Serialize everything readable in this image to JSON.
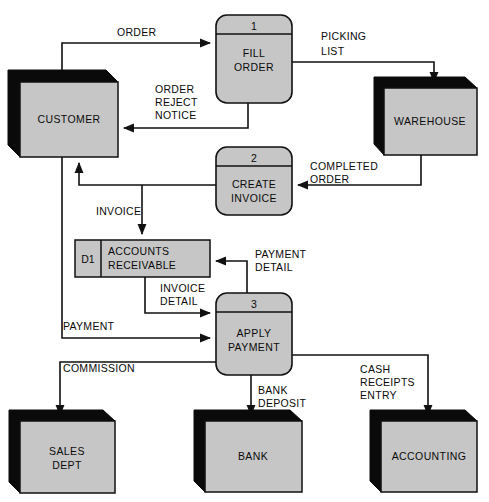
{
  "diagram": {
    "type": "data-flow-diagram",
    "colors": {
      "fill": "#c6c6c6",
      "stroke": "#111111",
      "shadow": "#0a0a0a",
      "background": "#ffffff"
    }
  },
  "external_entities": [
    {
      "id": "customer",
      "label": "CUSTOMER",
      "x": 20,
      "y": 82,
      "w": 98,
      "h": 75
    },
    {
      "id": "warehouse",
      "label": "WAREHOUSE",
      "x": 384,
      "y": 88,
      "w": 93,
      "h": 67
    },
    {
      "id": "sales_dept",
      "label_line1": "SALES",
      "label_line2": "DEPT",
      "x": 20,
      "y": 421,
      "w": 95,
      "h": 72
    },
    {
      "id": "bank",
      "label": "BANK",
      "x": 205,
      "y": 421,
      "w": 97,
      "h": 71
    },
    {
      "id": "accounting",
      "label": "ACCOUNTING",
      "x": 381,
      "y": 421,
      "w": 96,
      "h": 71
    }
  ],
  "processes": [
    {
      "id": "fill_order",
      "number": "1",
      "label_line1": "FILL",
      "label_line2": "ORDER",
      "x": 216,
      "y": 15,
      "w": 76,
      "h": 88
    },
    {
      "id": "create_invoice",
      "number": "2",
      "label_line1": "CREATE",
      "label_line2": "INVOICE",
      "x": 216,
      "y": 147,
      "w": 76,
      "h": 68
    },
    {
      "id": "apply_payment",
      "number": "3",
      "label_line1": "APPLY",
      "label_line2": "PAYMENT",
      "x": 216,
      "y": 293,
      "w": 76,
      "h": 82
    }
  ],
  "data_stores": [
    {
      "id": "accounts_receivable",
      "store_id": "D1",
      "label_line1": "ACCOUNTS",
      "label_line2": "RECEIVABLE",
      "x": 75,
      "y": 240,
      "w": 135,
      "h": 37,
      "divider_x": 101
    }
  ],
  "data_flows": [
    {
      "id": "order",
      "label": "ORDER",
      "from": "customer",
      "to": "fill_order"
    },
    {
      "id": "picking_list",
      "label_line1": "PICKING",
      "label_line2": "LIST",
      "from": "fill_order",
      "to": "warehouse"
    },
    {
      "id": "order_reject",
      "label_line1": "ORDER",
      "label_line2": "REJECT",
      "label_line3": "NOTICE",
      "from": "fill_order",
      "to": "customer"
    },
    {
      "id": "completed_order",
      "label_line1": "COMPLETED",
      "label_line2": "ORDER",
      "from": "warehouse",
      "to": "create_invoice"
    },
    {
      "id": "invoice",
      "label": "INVOICE",
      "from": "create_invoice",
      "to": "customer"
    },
    {
      "id": "invoice_store",
      "label": "INVOICE",
      "from": "create_invoice",
      "to": "accounts_receivable"
    },
    {
      "id": "invoice_detail",
      "label_line1": "INVOICE",
      "label_line2": "DETAIL",
      "from": "accounts_receivable",
      "to": "apply_payment"
    },
    {
      "id": "payment_detail",
      "label_line1": "PAYMENT",
      "label_line2": "DETAIL",
      "from": "apply_payment",
      "to": "accounts_receivable"
    },
    {
      "id": "payment",
      "label": "PAYMENT",
      "from": "customer",
      "to": "apply_payment"
    },
    {
      "id": "commission",
      "label": "COMMISSION",
      "from": "apply_payment",
      "to": "sales_dept"
    },
    {
      "id": "bank_deposit",
      "label_line1": "BANK",
      "label_line2": "DEPOSIT",
      "from": "apply_payment",
      "to": "bank"
    },
    {
      "id": "cash_receipts",
      "label_line1": "CASH",
      "label_line2": "RECEIPTS",
      "label_line3": "ENTRY",
      "from": "apply_payment",
      "to": "accounting"
    }
  ],
  "labels": {
    "order": "ORDER",
    "picking_1": "PICKING",
    "picking_2": "LIST",
    "reject_1": "ORDER",
    "reject_2": "REJECT",
    "reject_3": "NOTICE",
    "completed_1": "COMPLETED",
    "completed_2": "ORDER",
    "invoice": "INVOICE",
    "invoice_detail_1": "INVOICE",
    "invoice_detail_2": "DETAIL",
    "payment_detail_1": "PAYMENT",
    "payment_detail_2": "DETAIL",
    "payment": "PAYMENT",
    "commission": "COMMISSION",
    "bank_deposit_1": "BANK",
    "bank_deposit_2": "DEPOSIT",
    "cash_1": "CASH",
    "cash_2": "RECEIPTS",
    "cash_3": "ENTRY"
  }
}
